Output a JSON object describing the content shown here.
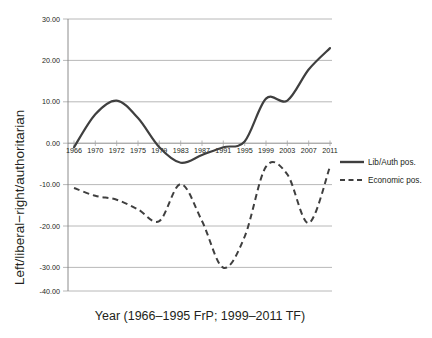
{
  "chart_data": {
    "type": "line",
    "title": "",
    "xlabel": "Year (1966–1995 FrP; 1999–2011 TF)",
    "ylabel": "Left/liberal−right/authoritarian",
    "categories": [
      "1966",
      "1970",
      "1972",
      "1975",
      "1979",
      "1983",
      "1987",
      "1991",
      "1995",
      "1999",
      "2003",
      "2007",
      "2011"
    ],
    "x_tick_labels": [
      "1966",
      "1970",
      "1972",
      "1975",
      "1979",
      "1983",
      "1987",
      "1991",
      "1995",
      "1999",
      "2003",
      "2007",
      "2011"
    ],
    "y_tick_labels": [
      "30.00",
      "20.00",
      "10.00",
      "0.00",
      "-10.00",
      "-20.00",
      "-30.00",
      "-40.00"
    ],
    "y_tick_values": [
      30,
      20,
      10,
      0,
      -10,
      -20,
      -30,
      -40
    ],
    "ylim": [
      -40,
      30
    ],
    "grid": true,
    "legend_position": "right",
    "series": [
      {
        "name": "Lib/Auth pos.",
        "style": "solid",
        "color": "#3f3f3f",
        "values": [
          -3.0,
          5.5,
          9.0,
          4.5,
          -3.0,
          -7.0,
          -5.0,
          -3.0,
          -1.5,
          9.5,
          9.0,
          17.0,
          22.5
        ]
      },
      {
        "name": "Economic pos.",
        "style": "dashed",
        "color": "#3f3f3f",
        "values": [
          -13.5,
          -15.5,
          -16.5,
          -19.0,
          -22.0,
          -12.5,
          -22.0,
          -34.0,
          -26.0,
          -8.0,
          -10.0,
          -22.5,
          -8.0
        ]
      }
    ]
  },
  "legend": {
    "entries": [
      {
        "label": "Lib/Auth pos.",
        "style": "solid"
      },
      {
        "label": "Economic pos.",
        "style": "dashed"
      }
    ]
  },
  "axes": {
    "x_title": "Year (1966–1995 FrP; 1999–2011 TF)",
    "y_title": "Left/liberal−right/authoritarian"
  },
  "ticks": {
    "y": [
      "30.00",
      "20.00",
      "10.00",
      "0.00",
      "-10.00",
      "-20.00",
      "-30.00",
      "-40.00"
    ],
    "x": [
      "1966",
      "1970",
      "1972",
      "1975",
      "1979",
      "1983",
      "1987",
      "1991",
      "1995",
      "1999",
      "2003",
      "2007",
      "2011"
    ]
  }
}
